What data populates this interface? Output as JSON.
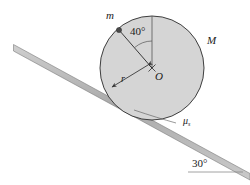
{
  "figure": {
    "type": "physics-diagram"
  },
  "colors": {
    "background": "#ffffff",
    "disk_fill": "#d5d5d5",
    "disk_stroke": "#2b2b2b",
    "incline_fill": "#b5b5b5",
    "incline_stroke": "#6e6e6e",
    "line": "#3a3a3a",
    "text": "#1a1a1a",
    "point_mass": "#4a4a4a"
  },
  "labels": {
    "small_mass": "m",
    "big_mass": "M",
    "center": "O",
    "radius": "r",
    "wheel_angle": "40°",
    "friction": "μ",
    "friction_sub": "s",
    "incline_angle": "30°"
  },
  "geometry": {
    "circle": {
      "cx": 152,
      "cy": 68,
      "r": 52
    },
    "incline": {
      "x1": 14,
      "y1": 47,
      "x2": 250,
      "y2": 176,
      "angle_deg": 30
    },
    "point_mass": {
      "x": 119,
      "y": 30
    },
    "vertical_radius_top": {
      "x": 152,
      "y": 16
    },
    "radius_arrow_end": {
      "x": 110,
      "y": 89
    }
  }
}
